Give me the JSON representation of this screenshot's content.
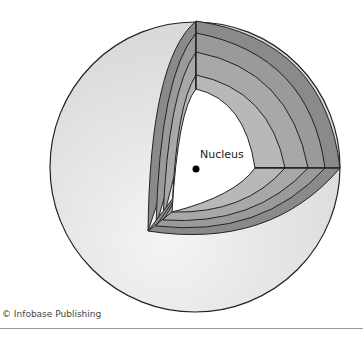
{
  "diagram": {
    "type": "cutaway-sphere",
    "label": "Nucleus",
    "layers": 5,
    "colors": {
      "sphere_fill": "#e2e2e2",
      "layer_dark": "#8a8a8a",
      "layer_mid": "#a3a3a3",
      "layer_light": "#bdbdbd",
      "core": "#ffffff",
      "outline": "#222222"
    }
  },
  "footer": {
    "credit": "© Infobase Publishing"
  }
}
